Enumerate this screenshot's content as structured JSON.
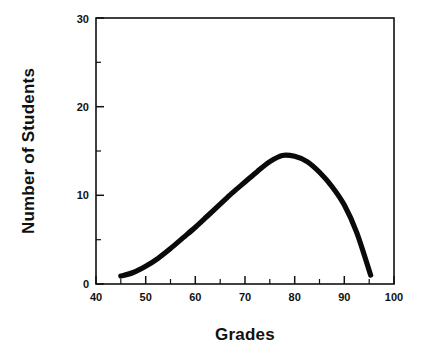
{
  "chart_data": {
    "type": "line",
    "title": "",
    "subtitle": "",
    "xlabel": "Grades",
    "ylabel": "Number of Students",
    "xlim": [
      40,
      100
    ],
    "ylim": [
      0,
      30
    ],
    "x_major_ticks": [
      40,
      50,
      60,
      70,
      80,
      90,
      100
    ],
    "x_minor_ticks": [
      45,
      55,
      65,
      75,
      85,
      95
    ],
    "y_major_ticks": [
      0,
      10,
      20,
      30
    ],
    "y_minor_ticks": [
      5,
      15,
      25
    ],
    "x_tick_labels": [
      "40",
      "50",
      "60",
      "70",
      "80",
      "90",
      "100"
    ],
    "y_tick_labels": [
      "0",
      "10",
      "20",
      "30"
    ],
    "grid": false,
    "legend": false,
    "legend_position": "none",
    "series": [
      {
        "name": "Grade distribution",
        "color": "#0a0a0a",
        "line_width": 5.2,
        "x": [
          45,
          47.5,
          50,
          52.5,
          55,
          57.5,
          60,
          62.5,
          65,
          67.5,
          70,
          72.5,
          75,
          77.5,
          80,
          82.5,
          85,
          87.5,
          90,
          92.5,
          95.3
        ],
        "y": [
          0.9,
          1.3,
          2.0,
          2.9,
          4.0,
          5.2,
          6.4,
          7.7,
          9.0,
          10.3,
          11.5,
          12.7,
          13.8,
          14.5,
          14.4,
          13.8,
          12.6,
          11.0,
          8.9,
          5.8,
          1.0
        ]
      }
    ],
    "peak": {
      "x": 77.5,
      "y": 14.5
    },
    "start_point": {
      "x": 45,
      "y": 0.9
    },
    "end_point": {
      "x": 95.3,
      "y": 1.0
    },
    "background_color": "#ffffff",
    "axis_color": "#111111"
  },
  "figure": {
    "x_axis_title": "Grades",
    "y_axis_title": "Number of Students"
  }
}
